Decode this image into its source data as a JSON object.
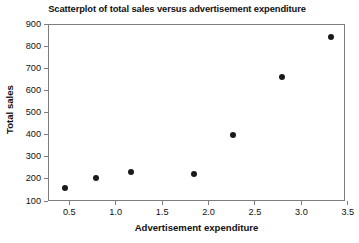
{
  "chart_data": {
    "type": "scatter",
    "title": "Scatterplot of total sales versus advertisement expenditure",
    "xlabel": "Advertisement expenditure",
    "ylabel": "Total sales",
    "xlim": [
      0.27,
      3.47
    ],
    "ylim": [
      100,
      900
    ],
    "xticks": [
      "0.5",
      "1.0",
      "1.5",
      "2.0",
      "2.5",
      "3.0",
      "3.5"
    ],
    "xtick_values": [
      0.5,
      1.0,
      1.5,
      2.0,
      2.5,
      3.0,
      3.5
    ],
    "yticks": [
      "100",
      "200",
      "300",
      "400",
      "500",
      "600",
      "700",
      "800",
      "900"
    ],
    "ytick_values": [
      100,
      200,
      300,
      400,
      500,
      600,
      700,
      800,
      900
    ],
    "grid": false,
    "legend": null,
    "marker": "filled-circle",
    "marker_color": "#1a1a1a",
    "frame_color": "#7d7d7d",
    "background": "#ffffff",
    "points": [
      {
        "x": 0.44,
        "y": 163
      },
      {
        "x": 0.78,
        "y": 210
      },
      {
        "x": 1.15,
        "y": 235
      },
      {
        "x": 1.83,
        "y": 225
      },
      {
        "x": 2.25,
        "y": 405
      },
      {
        "x": 2.78,
        "y": 665
      },
      {
        "x": 3.31,
        "y": 845
      }
    ]
  }
}
